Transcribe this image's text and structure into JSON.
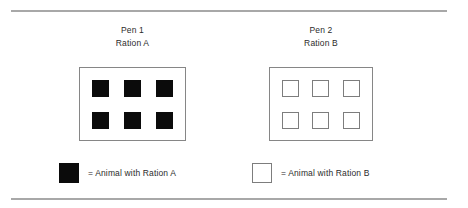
{
  "figure": {
    "background_color": "#ffffff",
    "rules": {
      "color": "#a8a8a8",
      "top_label": "top-divider-rule",
      "bottom_label": "bottom-divider-rule"
    }
  },
  "pens": [
    {
      "id": "pen-1",
      "name_line": "Pen 1",
      "ration_line": "Ration A",
      "animal_count": 6,
      "animal_style": "filled",
      "animal_color": "#0b0b0b",
      "border_color": "#868686",
      "columns": 3,
      "rows": 2
    },
    {
      "id": "pen-2",
      "name_line": "Pen 2",
      "ration_line": "Ration B",
      "animal_count": 6,
      "animal_style": "hollow",
      "animal_color": "#ffffff",
      "border_color": "#868686",
      "columns": 3,
      "rows": 2
    }
  ],
  "legend": [
    {
      "id": "legend-ration-a",
      "swatch_style": "filled",
      "swatch_color": "#0b0b0b",
      "text": "= Animal with Ration A"
    },
    {
      "id": "legend-ration-b",
      "swatch_style": "hollow",
      "swatch_color": "#ffffff",
      "text": "= Animal with Ration B"
    }
  ]
}
